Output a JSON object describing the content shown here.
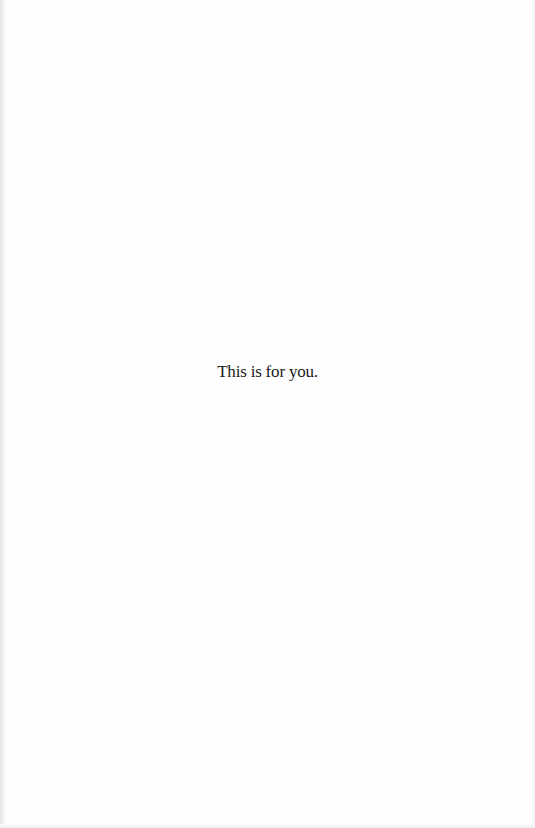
{
  "page": {
    "type": "dedication",
    "dedication_text": "This is for you.",
    "background_color": "#fefefe",
    "text_color": "#1a1a1a"
  }
}
